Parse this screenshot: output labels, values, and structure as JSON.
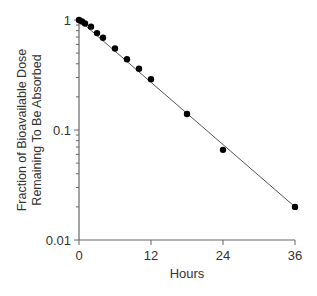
{
  "chart_data": {
    "type": "scatter",
    "title": "",
    "xlabel": "Hours",
    "ylabel": "Fraction of Bioavailable Dose Remaining To Be Absorbed",
    "ylabel_lines": [
      "Fraction of Bioavailable Dose",
      "Remaining To Be Absorbed"
    ],
    "yscale": "log",
    "xlim": [
      0,
      36
    ],
    "ylim": [
      0.01,
      1
    ],
    "x_ticks": [
      "0",
      "12",
      "24",
      "36"
    ],
    "y_ticks": [
      "0.01",
      "0.1",
      "1"
    ],
    "grid": false,
    "series": [
      {
        "name": "Fraction remaining",
        "x": [
          0,
          0.5,
          1,
          2,
          3,
          4,
          6,
          8,
          10,
          12,
          18,
          24,
          36
        ],
        "y": [
          1.0,
          0.97,
          0.93,
          0.87,
          0.76,
          0.69,
          0.55,
          0.44,
          0.36,
          0.29,
          0.14,
          0.066,
          0.02
        ],
        "marker": "filled-circle",
        "fit_line": true
      }
    ],
    "colors": {
      "points": "#000000",
      "line": "#555555",
      "axis": "#666666"
    }
  }
}
